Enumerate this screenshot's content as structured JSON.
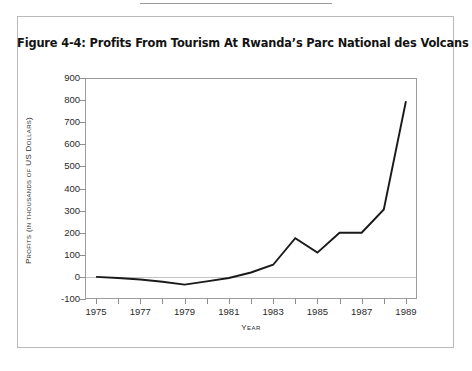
{
  "page": {
    "background_color": "#ffffff",
    "border_color": "#b9b9b9"
  },
  "figure": {
    "title": "Figure 4-4: Profits From Tourism At Rwanda’s Parc National des Volcans"
  },
  "axis": {
    "x_title": "Year",
    "y_title": "Profits (in thousands of US Dollars)",
    "line_color": "#1a1a1a",
    "frame_color": "#9d9d9d"
  },
  "chart_data": {
    "type": "line",
    "title": "Figure 4-4: Profits From Tourism At Rwanda’s Parc National des Volcans",
    "xlabel": "Year",
    "ylabel": "Profits (in thousands of US Dollars)",
    "x": [
      1975,
      1976,
      1977,
      1978,
      1979,
      1980,
      1981,
      1982,
      1983,
      1984,
      1985,
      1986,
      1987,
      1988,
      1989
    ],
    "values": [
      0,
      -5,
      -12,
      -22,
      -35,
      -20,
      -5,
      20,
      55,
      175,
      110,
      200,
      200,
      305,
      795
    ],
    "xlim": [
      1974.5,
      1989.5
    ],
    "ylim": [
      -100,
      900
    ],
    "xticks": [
      1975,
      1976,
      1977,
      1978,
      1979,
      1980,
      1981,
      1982,
      1983,
      1984,
      1985,
      1986,
      1987,
      1988,
      1989
    ],
    "xtick_labels": [
      "1975",
      "",
      "1977",
      "",
      "1979",
      "",
      "1981",
      "",
      "1983",
      "",
      "1985",
      "",
      "1987",
      "",
      "1989"
    ],
    "yticks": [
      -100,
      0,
      100,
      200,
      300,
      400,
      500,
      600,
      700,
      800,
      900
    ],
    "ytick_labels": [
      "-100",
      "0",
      "100",
      "200",
      "300",
      "400",
      "500",
      "600",
      "700",
      "800",
      "900"
    ],
    "grid": false,
    "legend": false,
    "zero_line": true,
    "series_color": "#1a1a1a"
  }
}
